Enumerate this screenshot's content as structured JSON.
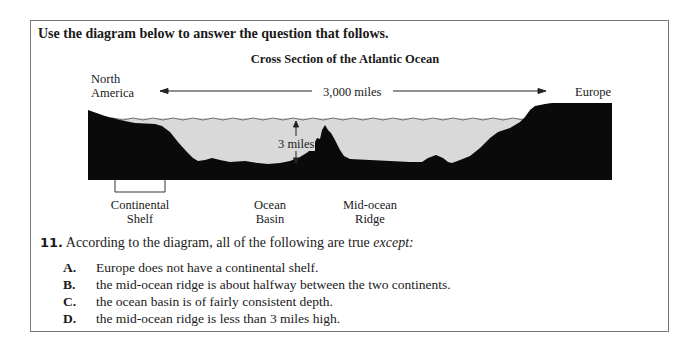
{
  "instruction": "Use the diagram below to answer the question that follows.",
  "diagram": {
    "title": "Cross Section of the Atlantic Ocean",
    "labels": {
      "left_continent_line1": "North",
      "left_continent_line2": "America",
      "right_continent": "Europe",
      "distance": "3,000 miles",
      "depth": "3 miles"
    },
    "features": [
      {
        "line1": "Continental",
        "line2": "Shelf"
      },
      {
        "line1": "Ocean",
        "line2": "Basin"
      },
      {
        "line1": "Mid-ocean",
        "line2": "Ridge"
      }
    ],
    "colors": {
      "land": "#0a0a0a",
      "water": "#d9d9d9"
    }
  },
  "question": {
    "number": "11.",
    "stem": "According to the diagram, all of the following are true ",
    "stem_emphasis": "except:",
    "options": [
      {
        "letter": "A.",
        "text": "Europe does not have a continental shelf."
      },
      {
        "letter": "B.",
        "text": "the mid-ocean ridge is about halfway between the two continents."
      },
      {
        "letter": "C.",
        "text": "the ocean basin is of fairly consistent depth."
      },
      {
        "letter": "D.",
        "text": "the mid-ocean ridge is less than 3 miles high."
      }
    ]
  }
}
